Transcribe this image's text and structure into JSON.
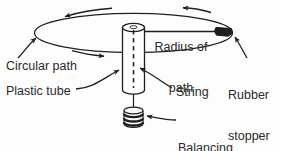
{
  "diagram": {
    "background_color": "#fdfdfd",
    "stroke_color": "#1f1f1f",
    "text_color": "#2a2a2a",
    "labels": {
      "radius_of_path_line1": "Radius of",
      "radius_of_path_line2": "path",
      "circular_path": "Circular path",
      "plastic_tube": "Plastic tube",
      "string": "String",
      "rubber_stopper_line1": "Rubber",
      "rubber_stopper_line2": "stopper",
      "balancing_weights_line1": "Balancing",
      "balancing_weights_line2": "wcights"
    },
    "parts": [
      {
        "name": "circular-path-ellipse",
        "label": "Circular path"
      },
      {
        "name": "rubber-stopper",
        "label": "Rubber stopper"
      },
      {
        "name": "radius-line",
        "label": "Radius of path"
      },
      {
        "name": "plastic-tube",
        "label": "Plastic tube"
      },
      {
        "name": "string",
        "label": "String"
      },
      {
        "name": "balancing-weights",
        "label": "Balancing wcights"
      }
    ],
    "motion_arrows": [
      {
        "name": "rotation-arrow-top-left",
        "direction": "left"
      },
      {
        "name": "rotation-arrow-top-right",
        "direction": "left"
      },
      {
        "name": "rotation-arrow-bottom-left",
        "direction": "right"
      }
    ]
  }
}
